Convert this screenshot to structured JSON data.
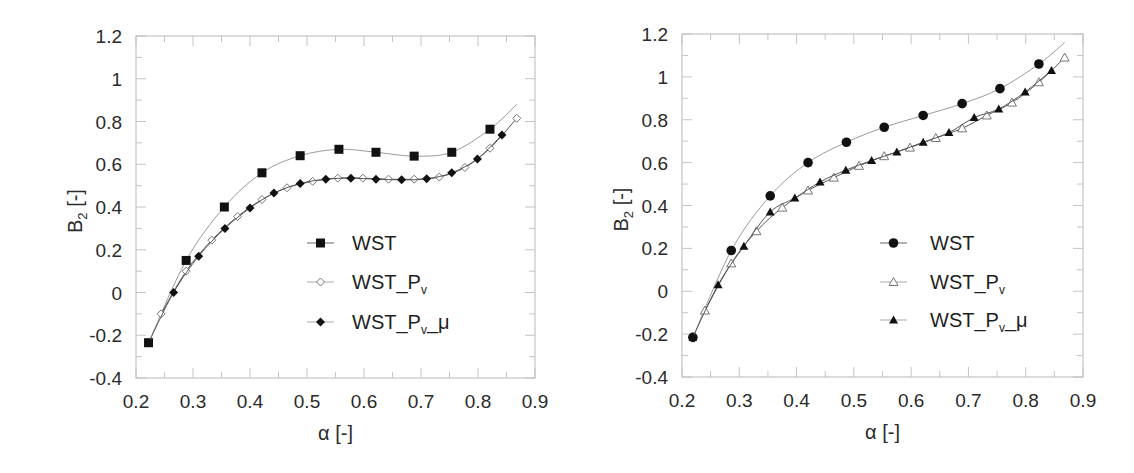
{
  "chart_data": [
    {
      "type": "line",
      "panel": "left",
      "title": "",
      "xlabel": "α [-]",
      "ylabel": "B2 [-]",
      "ylabel_main": "B",
      "ylabel_sub": "2",
      "ylabel_tail": " [-]",
      "xlim": [
        0.2,
        0.9
      ],
      "ylim": [
        -0.4,
        1.2
      ],
      "xticks": [
        "0.2",
        "0.3",
        "0.4",
        "0.5",
        "0.6",
        "0.7",
        "0.8",
        "0.9"
      ],
      "yticks": [
        "1.2",
        "1",
        "0.8",
        "0.6",
        "0.4",
        "0.2",
        "0",
        "-0.2",
        "-0.4"
      ],
      "grid": false,
      "legend_position": "center-right",
      "series": [
        {
          "name": "WST",
          "label_main": "WST",
          "marker": "square-filled",
          "x": [
            0.222,
            0.288,
            0.355,
            0.421,
            0.488,
            0.556,
            0.621,
            0.688,
            0.754,
            0.821
          ],
          "y": [
            -0.235,
            0.15,
            0.4,
            0.56,
            0.64,
            0.67,
            0.656,
            0.638,
            0.656,
            0.764
          ],
          "curve_end": [
            0.868,
            0.88
          ]
        },
        {
          "name": "WST_Pv",
          "label_main": "WST_P",
          "label_sub": "v",
          "marker": "diamond-open",
          "x": [
            0.244,
            0.288,
            0.333,
            0.378,
            0.421,
            0.465,
            0.51,
            0.554,
            0.598,
            0.643,
            0.688,
            0.732,
            0.777,
            0.821,
            0.868
          ],
          "y": [
            -0.1,
            0.1,
            0.245,
            0.355,
            0.435,
            0.49,
            0.52,
            0.535,
            0.535,
            0.53,
            0.53,
            0.54,
            0.585,
            0.675,
            0.815
          ]
        },
        {
          "name": "WST_Pv_μ",
          "label_main": "WST_P",
          "label_sub": "v",
          "label_tail": "_μ",
          "marker": "diamond-filled",
          "x": [
            0.222,
            0.266,
            0.31,
            0.356,
            0.4,
            0.442,
            0.488,
            0.533,
            0.577,
            0.621,
            0.666,
            0.71,
            0.754,
            0.799,
            0.842
          ],
          "y": [
            -0.235,
            0.0,
            0.17,
            0.3,
            0.395,
            0.465,
            0.51,
            0.53,
            0.535,
            0.53,
            0.527,
            0.532,
            0.56,
            0.625,
            0.737
          ]
        }
      ]
    },
    {
      "type": "line",
      "panel": "right",
      "title": "",
      "xlabel": "α [-]",
      "ylabel": "B2 [-]",
      "ylabel_main": "B",
      "ylabel_sub": "2",
      "ylabel_tail": " [-]",
      "xlim": [
        0.2,
        0.9
      ],
      "ylim": [
        -0.4,
        1.2
      ],
      "xticks": [
        "0.2",
        "0.3",
        "0.4",
        "0.5",
        "0.6",
        "0.7",
        "0.8",
        "0.9"
      ],
      "yticks": [
        "1.2",
        "1",
        "0.8",
        "0.6",
        "0.4",
        "0.2",
        "0",
        "-0.2",
        "-0.4"
      ],
      "grid": false,
      "legend_position": "center-right",
      "series": [
        {
          "name": "WST",
          "label_main": "WST",
          "marker": "circle-filled",
          "x": [
            0.219,
            0.286,
            0.354,
            0.42,
            0.553,
            0.487,
            0.621,
            0.689,
            0.755,
            0.823
          ],
          "y": [
            -0.215,
            0.19,
            0.445,
            0.6,
            0.765,
            0.695,
            0.82,
            0.875,
            0.945,
            1.06
          ],
          "curve_end": [
            0.868,
            1.16
          ]
        },
        {
          "name": "WST_Pv",
          "label_main": "WST_P",
          "label_sub": "v",
          "marker": "triangle-open",
          "x": [
            0.24,
            0.286,
            0.33,
            0.375,
            0.42,
            0.465,
            0.509,
            0.553,
            0.598,
            0.643,
            0.689,
            0.732,
            0.776,
            0.823,
            0.868
          ],
          "y": [
            -0.09,
            0.13,
            0.28,
            0.39,
            0.47,
            0.53,
            0.585,
            0.63,
            0.67,
            0.715,
            0.76,
            0.82,
            0.88,
            0.975,
            1.09
          ]
        },
        {
          "name": "WST_Pv_μ",
          "label_main": "WST_P",
          "label_sub": "v",
          "label_tail": "_μ",
          "marker": "triangle-filled",
          "x": [
            0.219,
            0.263,
            0.308,
            0.354,
            0.397,
            0.441,
            0.486,
            0.531,
            0.575,
            0.621,
            0.666,
            0.71,
            0.753,
            0.799,
            0.845
          ],
          "y": [
            -0.215,
            0.03,
            0.21,
            0.37,
            0.435,
            0.51,
            0.565,
            0.61,
            0.65,
            0.695,
            0.74,
            0.81,
            0.85,
            0.93,
            1.03
          ]
        }
      ]
    }
  ],
  "layout": {
    "left": {
      "x0": 136,
      "x1": 535,
      "y0": 36,
      "y1": 378,
      "legend_x": 307,
      "legend_text_x": 352,
      "legend_y": [
        243,
        282,
        322
      ]
    },
    "right": {
      "x0": 115,
      "x1": 516,
      "y0": 34,
      "y1": 377,
      "legend_x": 313,
      "legend_text_x": 363,
      "legend_y": [
        243,
        282,
        320
      ]
    }
  },
  "colors": {
    "frame": "#b8b8b8",
    "curve": "#9a9a9a",
    "marker": "#111111",
    "text": "#2a2a2a"
  }
}
